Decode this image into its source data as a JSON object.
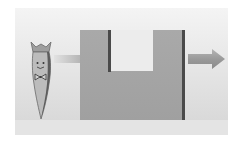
{
  "diagram": {
    "colors": {
      "background": "#ffffff",
      "panel_top": "#f3f3f3",
      "panel_bottom": "#dedede",
      "ground": "#e3e3e3",
      "block_fill": "#a6a6a6",
      "block_edge": "#4a4a4a",
      "notch_fill": "#e9e9e9",
      "arrow_fill": "#9c9c9c",
      "arrow_in_fill": "#bdbdbd",
      "carrot_fill": "#b8b8b8",
      "carrot_outline": "#5a5a5a",
      "carrot_leaf": "#a0a0a0"
    },
    "elements": {
      "carrot": {
        "label": "carrot-character",
        "features": [
          "leafy-top",
          "smiling-face",
          "bow-tie"
        ]
      },
      "input_arrow": {
        "label": "inflow-arrow",
        "direction": "right"
      },
      "u_block": {
        "label": "u-shaped-block"
      },
      "output_arrow": {
        "label": "outflow-arrow",
        "direction": "right"
      }
    }
  }
}
